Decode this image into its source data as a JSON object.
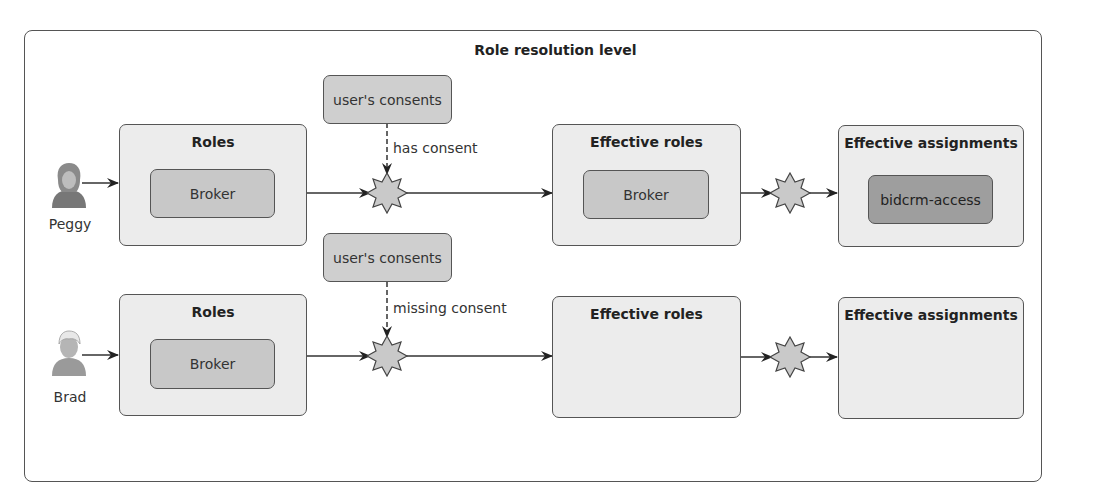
{
  "diagram": {
    "title": "Role resolution level",
    "rows": [
      {
        "user": {
          "name": "Peggy",
          "icon": "user-female-icon"
        },
        "roles": {
          "title": "Roles",
          "items": [
            "Broker"
          ]
        },
        "consents": {
          "label": "user's consents",
          "edge_label": "has consent"
        },
        "effective_roles": {
          "title": "Effective roles",
          "items": [
            "Broker"
          ]
        },
        "effective_assignments": {
          "title": "Effective assignments",
          "items": [
            "bidcrm-access"
          ]
        }
      },
      {
        "user": {
          "name": "Brad",
          "icon": "user-male-icon"
        },
        "roles": {
          "title": "Roles",
          "items": [
            "Broker"
          ]
        },
        "consents": {
          "label": "user's consents",
          "edge_label": "missing consent"
        },
        "effective_roles": {
          "title": "Effective roles",
          "items": []
        },
        "effective_assignments": {
          "title": "Effective assignments",
          "items": []
        }
      }
    ],
    "colors": {
      "container_fill": "#ececec",
      "role_chip_fill": "#c8c8c8",
      "assignment_chip_fill": "#9e9e9e",
      "consent_fill": "#cfcfcf",
      "star_fill": "#c9c9c9",
      "stroke": "#555555"
    }
  }
}
